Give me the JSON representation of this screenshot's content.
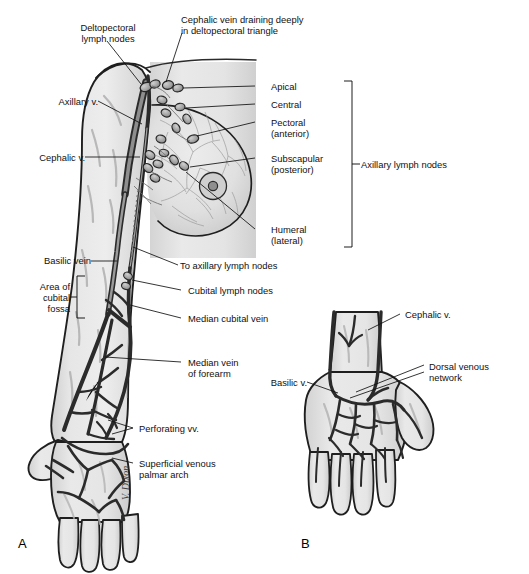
{
  "figure": {
    "background_color": "#ffffff",
    "ink_color": "#1a1a1a",
    "skin_fill": "#e3e3e3",
    "skin_shade": "#c9c9c9",
    "vein_fill": "#9a9a9a",
    "vein_stroke": "#2b2b2b",
    "node_fill": "#a8a8a8",
    "leader_color": "#111111"
  },
  "panels": [
    {
      "id": "A",
      "letter": "A",
      "caption": "Upper limb superficial veins and axillary lymph nodes, anterior view"
    },
    {
      "id": "B",
      "letter": "B",
      "caption": "Dorsum of hand, dorsal venous network"
    }
  ],
  "labels": {
    "deltopectoral_lymph_nodes": "Deltopectoral\nlymph nodes",
    "cephalic_vein_draining": "Cephalic vein draining deeply\nin deltopectoral triangle",
    "axillary_v": "Axillary v.",
    "cephalic_v": "Cephalic v.",
    "apical": "Apical",
    "central": "Central",
    "pectoral_anterior": "Pectoral\n(anterior)",
    "subscapular_posterior": "Subscapular\n(posterior)",
    "humeral_lateral": "Humeral\n(lateral)",
    "axillary_lymph_nodes": "Axillary lymph nodes",
    "basilic_vein": "Basilic vein",
    "area_of_cubital_fossa": "Area of\ncubital\nfossa",
    "to_axillary_lymph_nodes": "To axillary lymph nodes",
    "cubital_lymph_nodes": "Cubital lymph nodes",
    "median_cubital_vein": "Median cubital vein",
    "median_vein_of_forearm": "Median vein\nof forearm",
    "perforating_vv": "Perforating vv.",
    "superficial_venous_palmar_arch": "Superficial venous\npalmar arch",
    "cephalic_v_b": "Cephalic v.",
    "basilic_v_b": "Basilic v.",
    "dorsal_venous_network": "Dorsal venous\nnetwork",
    "artist_signature": "V. Dixon"
  }
}
